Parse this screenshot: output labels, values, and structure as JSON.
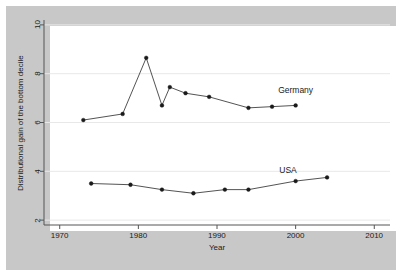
{
  "chart_data": {
    "type": "line",
    "title": "",
    "subtitle": "",
    "xlabel": "Year",
    "ylabel": "Distributional gain of the bottom decile",
    "xlim": [
      1968,
      2012
    ],
    "ylim": [
      1.8,
      10.2
    ],
    "xticks": [
      1970,
      1980,
      1990,
      2000,
      2010
    ],
    "xtick_labels": [
      "1970",
      "1980",
      "1990",
      "2000",
      "2010"
    ],
    "yticks": [
      2,
      4,
      6,
      8,
      10
    ],
    "ytick_labels": [
      "2",
      "4",
      "6",
      "8",
      "10"
    ],
    "grid": "horizontal",
    "legend_position": "inline-annotation",
    "marker": "filled-circle",
    "line_color": "#404040",
    "marker_color": "#1a1a1a",
    "plot_background": "#ffffff",
    "graph_background": "#c8c8c8",
    "gridline_color": "#e8e8e8",
    "series": [
      {
        "name": "Germany",
        "label": "Germany",
        "label_x": 2000,
        "label_y": 7.35,
        "x": [
          1973,
          1978,
          1981,
          1983,
          1984,
          1986,
          1989,
          1994,
          1997,
          2000
        ],
        "values": [
          6.1,
          6.35,
          8.65,
          6.7,
          7.45,
          7.2,
          7.05,
          6.6,
          6.65,
          6.7
        ]
      },
      {
        "name": "USA",
        "label": "USA",
        "label_x": 1999,
        "label_y": 4.05,
        "x": [
          1974,
          1979,
          1983,
          1987,
          1991,
          1994,
          2000,
          2004
        ],
        "values": [
          3.5,
          3.45,
          3.25,
          3.1,
          3.25,
          3.25,
          3.6,
          3.75
        ]
      }
    ]
  }
}
